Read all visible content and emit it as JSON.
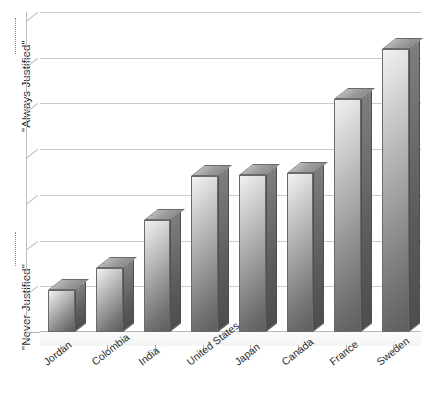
{
  "chart_data": {
    "type": "bar",
    "title": "",
    "subtitle": "",
    "xlabel": "",
    "ylabel": "",
    "axis_labels": {
      "y_top": "\"Always Justified\"",
      "y_bottom": "\"Never Justified\""
    },
    "categories": [
      "Jordan",
      "Colombia",
      "India",
      "United States",
      "Japan",
      "Canada",
      "France",
      "Sweden"
    ],
    "values": [
      1.0,
      1.55,
      2.7,
      3.75,
      3.78,
      3.83,
      5.6,
      6.8
    ],
    "ylim": [
      0,
      7.7
    ],
    "grid": true,
    "gridlines": 7,
    "y_tick_labels": [],
    "legend": "none",
    "style": "3d-grayscale-bars"
  },
  "colors": {
    "background": "#ffffff",
    "gridline": "#c9c9c9",
    "bar_front_light": "#f2f2f2",
    "bar_front_dark": "#5e5e5e",
    "bar_side": "#5c5c5c",
    "bar_top": "#9d9d9d",
    "text": "#2b2b2b"
  }
}
